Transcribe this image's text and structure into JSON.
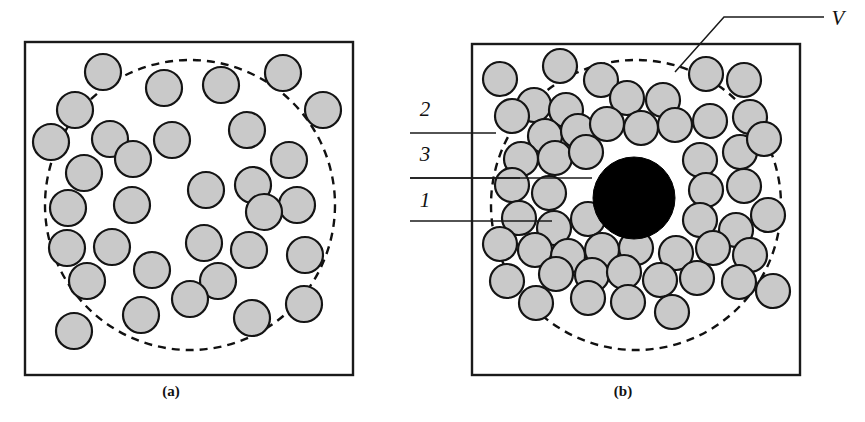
{
  "figure": {
    "background_color": "#ffffff",
    "particle_fill": "#c9c9c9",
    "particle_stroke": "#141414",
    "inclusion_fill": "#000000",
    "frame_stroke": "#1a1a1a"
  },
  "panels": [
    {
      "id": "a",
      "caption": "(a)",
      "caption_x": 171,
      "caption_y": 396,
      "frame": {
        "x": 25,
        "y": 42,
        "w": 328,
        "h": 333
      },
      "volume_circle": {
        "cx": 190,
        "cy": 205,
        "r": 145
      },
      "particle_radius": 18,
      "particles": [
        {
          "cx": 103,
          "cy": 72
        },
        {
          "cx": 75,
          "cy": 110
        },
        {
          "cx": 51,
          "cy": 142
        },
        {
          "cx": 110,
          "cy": 139
        },
        {
          "cx": 133,
          "cy": 159
        },
        {
          "cx": 84,
          "cy": 173
        },
        {
          "cx": 164,
          "cy": 88
        },
        {
          "cx": 221,
          "cy": 85
        },
        {
          "cx": 172,
          "cy": 140
        },
        {
          "cx": 247,
          "cy": 130
        },
        {
          "cx": 283,
          "cy": 73
        },
        {
          "cx": 323,
          "cy": 110
        },
        {
          "cx": 289,
          "cy": 160
        },
        {
          "cx": 68,
          "cy": 208
        },
        {
          "cx": 132,
          "cy": 205
        },
        {
          "cx": 206,
          "cy": 190
        },
        {
          "cx": 253,
          "cy": 185
        },
        {
          "cx": 297,
          "cy": 205
        },
        {
          "cx": 264,
          "cy": 212
        },
        {
          "cx": 204,
          "cy": 243
        },
        {
          "cx": 67,
          "cy": 248
        },
        {
          "cx": 112,
          "cy": 247
        },
        {
          "cx": 249,
          "cy": 250
        },
        {
          "cx": 87,
          "cy": 281
        },
        {
          "cx": 152,
          "cy": 270
        },
        {
          "cx": 218,
          "cy": 281
        },
        {
          "cx": 305,
          "cy": 255
        },
        {
          "cx": 190,
          "cy": 299
        },
        {
          "cx": 141,
          "cy": 315
        },
        {
          "cx": 74,
          "cy": 331
        },
        {
          "cx": 252,
          "cy": 318
        },
        {
          "cx": 304,
          "cy": 304
        }
      ]
    },
    {
      "id": "b",
      "caption": "(b)",
      "caption_x": 623,
      "caption_y": 396,
      "frame": {
        "x": 472,
        "y": 44,
        "w": 328,
        "h": 331
      },
      "volume_circle": {
        "cx": 636,
        "cy": 205,
        "r": 145
      },
      "inclusion": {
        "cx": 634,
        "cy": 198,
        "r": 41
      },
      "particle_radius": 17,
      "particles": [
        {
          "cx": 500,
          "cy": 79
        },
        {
          "cx": 560,
          "cy": 66
        },
        {
          "cx": 601,
          "cy": 80
        },
        {
          "cx": 534,
          "cy": 105
        },
        {
          "cx": 566,
          "cy": 110
        },
        {
          "cx": 627,
          "cy": 98
        },
        {
          "cx": 663,
          "cy": 100
        },
        {
          "cx": 706,
          "cy": 74
        },
        {
          "cx": 744,
          "cy": 80
        },
        {
          "cx": 512,
          "cy": 116
        },
        {
          "cx": 545,
          "cy": 136
        },
        {
          "cx": 578,
          "cy": 131
        },
        {
          "cx": 607,
          "cy": 124
        },
        {
          "cx": 641,
          "cy": 128
        },
        {
          "cx": 675,
          "cy": 125
        },
        {
          "cx": 710,
          "cy": 121
        },
        {
          "cx": 750,
          "cy": 117
        },
        {
          "cx": 521,
          "cy": 159
        },
        {
          "cx": 555,
          "cy": 158
        },
        {
          "cx": 586,
          "cy": 152
        },
        {
          "cx": 700,
          "cy": 160
        },
        {
          "cx": 740,
          "cy": 152
        },
        {
          "cx": 764,
          "cy": 139
        },
        {
          "cx": 512,
          "cy": 185
        },
        {
          "cx": 549,
          "cy": 193
        },
        {
          "cx": 706,
          "cy": 190
        },
        {
          "cx": 744,
          "cy": 186
        },
        {
          "cx": 519,
          "cy": 218
        },
        {
          "cx": 554,
          "cy": 228
        },
        {
          "cx": 588,
          "cy": 219
        },
        {
          "cx": 700,
          "cy": 220
        },
        {
          "cx": 736,
          "cy": 230
        },
        {
          "cx": 768,
          "cy": 215
        },
        {
          "cx": 500,
          "cy": 244
        },
        {
          "cx": 535,
          "cy": 250
        },
        {
          "cx": 568,
          "cy": 256
        },
        {
          "cx": 602,
          "cy": 250
        },
        {
          "cx": 636,
          "cy": 248
        },
        {
          "cx": 676,
          "cy": 253
        },
        {
          "cx": 713,
          "cy": 248
        },
        {
          "cx": 750,
          "cy": 255
        },
        {
          "cx": 507,
          "cy": 281
        },
        {
          "cx": 556,
          "cy": 274
        },
        {
          "cx": 592,
          "cy": 275
        },
        {
          "cx": 624,
          "cy": 272
        },
        {
          "cx": 660,
          "cy": 280
        },
        {
          "cx": 697,
          "cy": 278
        },
        {
          "cx": 739,
          "cy": 282
        },
        {
          "cx": 773,
          "cy": 291
        },
        {
          "cx": 588,
          "cy": 298
        },
        {
          "cx": 628,
          "cy": 302
        },
        {
          "cx": 536,
          "cy": 303
        },
        {
          "cx": 672,
          "cy": 312
        }
      ]
    }
  ],
  "callouts": [
    {
      "id": "label-2",
      "label": "2",
      "label_x": 425,
      "label_y": 116,
      "leader": "M 410 133 L 496 133",
      "meaning": "outer-region-particles"
    },
    {
      "id": "label-3",
      "label": "3",
      "label_x": 425,
      "label_y": 161,
      "leader": "M 410 178 L 520 178",
      "meaning": "volume-shell"
    },
    {
      "id": "label-1",
      "label": "1",
      "label_x": 425,
      "label_y": 207,
      "leader": "M 410 221 L 552 221",
      "meaning": "matrix-particle"
    },
    {
      "id": "label-V",
      "label": "V",
      "label_x": 838,
      "label_y": 25,
      "leader": "M 824 17 L 724 17 L 675 72",
      "meaning": "representative-volume"
    },
    {
      "id": "leader-inclusion",
      "label": "",
      "label_x": 0,
      "label_y": 0,
      "leader": "M 410 178 L 592 178",
      "meaning": "inclusion-pointer"
    }
  ]
}
